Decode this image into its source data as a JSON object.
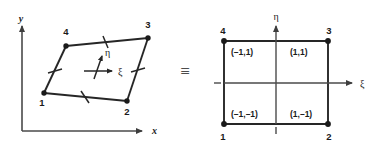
{
  "figure": {
    "equivalence_symbol": "≡",
    "colors": {
      "line": "#262626",
      "axis": "#4a4a4a",
      "node": "#1a1a1a",
      "background": "#ffffff"
    }
  },
  "physical_element": {
    "caption": "Distorted quadrilateral element in global x-y coordinates",
    "axes": {
      "x_label": "x",
      "y_label": "y"
    },
    "local_axes": {
      "xi_label": "ξ",
      "eta_label": "η"
    },
    "nodes": [
      {
        "label": "1",
        "x": 44,
        "y": 93
      },
      {
        "label": "2",
        "x": 127,
        "y": 101
      },
      {
        "label": "3",
        "x": 148,
        "y": 38
      },
      {
        "label": "4",
        "x": 66,
        "y": 46
      }
    ]
  },
  "parent_element": {
    "caption": "Parent square element in natural ξ-η coordinates",
    "axes": {
      "xi_label": "ξ",
      "eta_label": "η"
    },
    "nodes": [
      {
        "label": "1",
        "coord": "(–1,–1)",
        "xi": -1,
        "eta": -1
      },
      {
        "label": "2",
        "coord": "(1,–1)",
        "xi": 1,
        "eta": -1
      },
      {
        "label": "3",
        "coord": "(1,1)",
        "xi": 1,
        "eta": 1
      },
      {
        "label": "4",
        "coord": "(–1,1)",
        "xi": -1,
        "eta": 1
      }
    ],
    "tick_marks": {
      "left_tick": "–",
      "bottom_tick": "|"
    }
  }
}
